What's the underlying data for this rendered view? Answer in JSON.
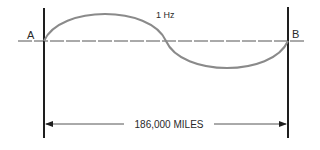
{
  "diagram": {
    "frequency_label": "1 Hz",
    "point_a_label": "A",
    "point_b_label": "B",
    "distance_label": "186,000 MILES",
    "colors": {
      "wave": "#8a8a8a",
      "lines": "#1e1e1e",
      "axis": "#555555",
      "text": "#2a2a2a"
    }
  }
}
